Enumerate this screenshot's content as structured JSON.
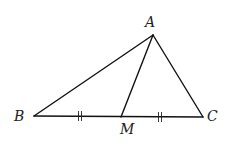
{
  "diagram": {
    "type": "triangle-with-median",
    "points": {
      "A": "A",
      "B": "B",
      "C": "C",
      "M": "M"
    },
    "segments": [
      "AB",
      "AC",
      "BC",
      "AM"
    ],
    "equal_marks": {
      "symbol": "||",
      "segments": [
        "BM",
        "MC"
      ]
    },
    "colors": {
      "line": "#111111",
      "label": "#222222"
    }
  }
}
